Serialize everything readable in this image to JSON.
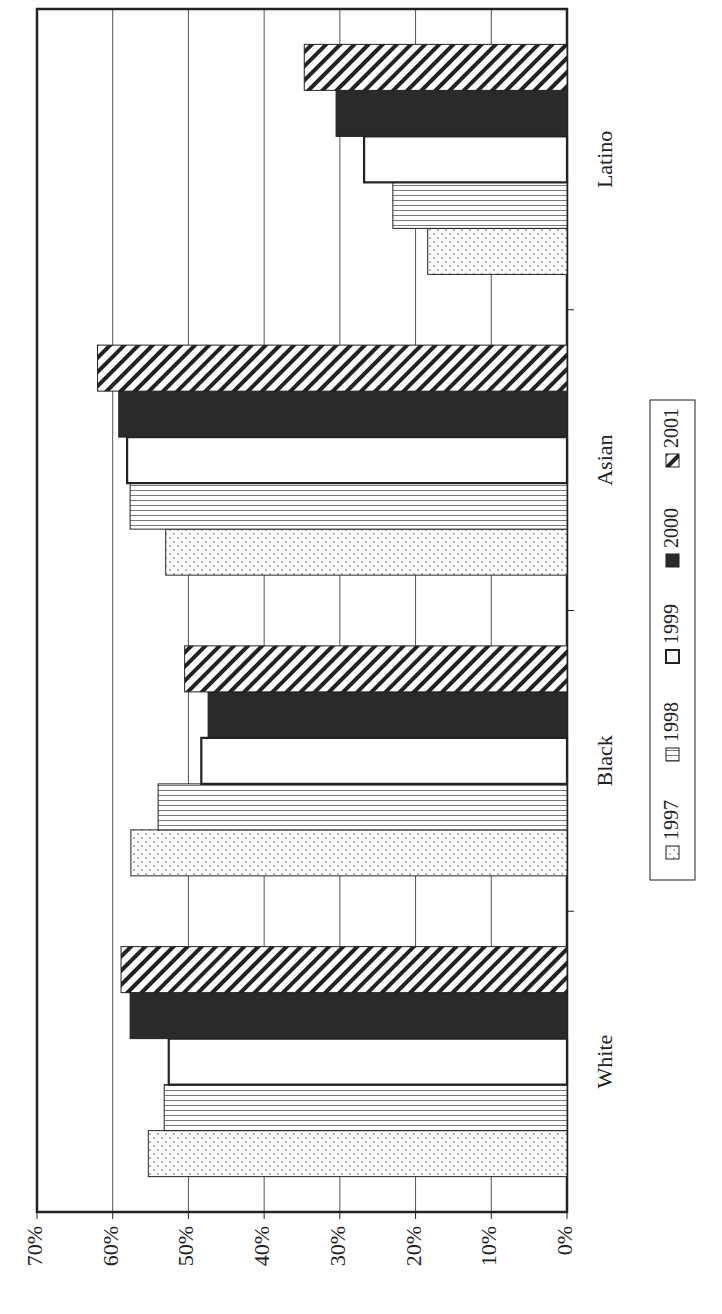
{
  "chart_data": {
    "type": "bar",
    "orientation": "rotated-horizontal",
    "title": "",
    "xlabel": "",
    "ylabel": "",
    "categories": [
      "White",
      "Black",
      "Asian",
      "Latino"
    ],
    "series": [
      {
        "name": "1997",
        "pattern": "dots",
        "values": [
          55.3,
          57.6,
          53.0,
          18.4
        ]
      },
      {
        "name": "1998",
        "pattern": "vertical-lines",
        "values": [
          53.2,
          54.0,
          57.7,
          23.0
        ]
      },
      {
        "name": "1999",
        "pattern": "white",
        "values": [
          52.6,
          48.3,
          58.1,
          26.8
        ]
      },
      {
        "name": "2000",
        "pattern": "solid-dark",
        "values": [
          57.7,
          47.4,
          59.2,
          30.5
        ]
      },
      {
        "name": "2001",
        "pattern": "diagonal-lines",
        "values": [
          58.9,
          50.5,
          62.0,
          34.7
        ]
      }
    ],
    "value_axis": {
      "min": 0,
      "max": 70,
      "ticks": [
        "0%",
        "10%",
        "20%",
        "30%",
        "40%",
        "50%",
        "60%",
        "70%"
      ],
      "tick_values": [
        0,
        10,
        20,
        30,
        40,
        50,
        60,
        70
      ]
    },
    "grid": true,
    "legend_position": "right",
    "colors": {
      "ink": "#222222",
      "dark_fill": "#2a2a2a",
      "grid": "#555555",
      "background": "#ffffff"
    }
  }
}
